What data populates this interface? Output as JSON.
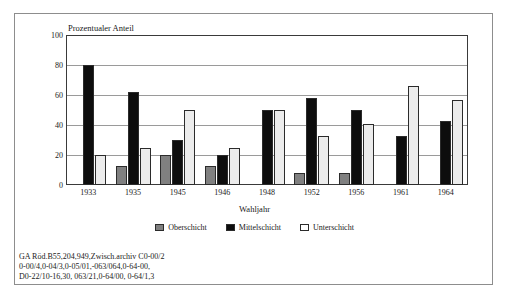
{
  "chart_data": {
    "type": "bar",
    "title": "",
    "ylabel": "Prozentualer Anteil",
    "xlabel": "Wahljahr",
    "ylim": [
      0,
      100
    ],
    "yticks": [
      0,
      20,
      40,
      60,
      80,
      100
    ],
    "grid": true,
    "legend_position": "bottom",
    "categories": [
      "1933",
      "1935",
      "1945",
      "1946",
      "1948",
      "1952",
      "1956",
      "1961",
      "1964"
    ],
    "series": [
      {
        "name": "Oberschicht",
        "color": "#808080",
        "values": [
          0,
          13,
          20,
          13,
          0,
          8,
          8,
          0,
          0
        ]
      },
      {
        "name": "Mittelschicht",
        "color": "#0d0d0d",
        "values": [
          80,
          62,
          30,
          20,
          50,
          58,
          50,
          33,
          43
        ]
      },
      {
        "name": "Unterschicht",
        "color": "#ffffff",
        "values": [
          20,
          25,
          50,
          25,
          50,
          33,
          41,
          66,
          57
        ]
      }
    ]
  },
  "footnote": {
    "lines": [
      "GA Röd.B55,204,949,Zwisch.archiv C0-00/2",
      "0-00/4,0-04/3,0-05/01,-063/064,0-64-00,",
      "D0-22/10-16,30, 063/21,0-64/00, 0-64/1,3"
    ]
  }
}
